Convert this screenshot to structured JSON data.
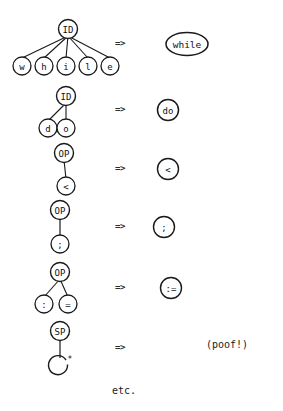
{
  "diagram": {
    "caption": "etc.",
    "arrow_symbol": "=>",
    "rules": [
      {
        "id": "rule-while",
        "tree": {
          "root_label": "ID",
          "children": [
            "w",
            "h",
            "i",
            "l",
            "e"
          ]
        },
        "arrow": "=>",
        "result": {
          "shape": "ellipse",
          "label": "while"
        }
      },
      {
        "id": "rule-do",
        "tree": {
          "root_label": "ID",
          "children": [
            "d",
            "o"
          ]
        },
        "arrow": "=>",
        "result": {
          "shape": "circle",
          "label": "do"
        }
      },
      {
        "id": "rule-lessthan",
        "tree": {
          "root_label": "OP",
          "children": [
            "<"
          ]
        },
        "arrow": "=>",
        "result": {
          "shape": "circle",
          "label": "<"
        }
      },
      {
        "id": "rule-semicolon",
        "tree": {
          "root_label": "OP",
          "children": [
            ";"
          ]
        },
        "arrow": "=>",
        "result": {
          "shape": "circle",
          "label": ";"
        }
      },
      {
        "id": "rule-assign",
        "tree": {
          "root_label": "OP",
          "children": [
            ":",
            "="
          ]
        },
        "arrow": "=>",
        "result": {
          "shape": "circle",
          "label": ":="
        }
      },
      {
        "id": "rule-space",
        "tree": {
          "root_label": "SP",
          "children": [
            "*"
          ]
        },
        "arrow": "=>",
        "result": {
          "shape": "text",
          "label": "(poof!)"
        }
      }
    ]
  }
}
